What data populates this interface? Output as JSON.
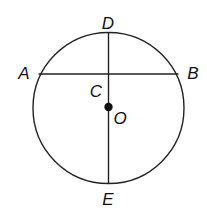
{
  "diagram": {
    "type": "circle-geometry",
    "circle": {
      "center_label": "O",
      "cx": 108.5,
      "cy": 108,
      "r": 76
    },
    "chord": {
      "from": "A",
      "to": "B"
    },
    "diameter_segment": {
      "from": "D",
      "to": "E"
    },
    "intersection": "C",
    "labels": {
      "A": "A",
      "B": "B",
      "C": "C",
      "D": "D",
      "E": "E",
      "O": "O"
    },
    "colors": {
      "stroke": "#222222",
      "background": "#ffffff"
    }
  }
}
